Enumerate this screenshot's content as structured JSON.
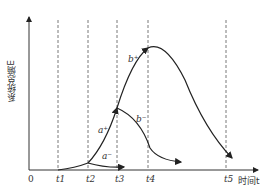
{
  "diagram": {
    "y_axis_label": "系统总熵E",
    "x_axis_label": "时间t",
    "origin": "0",
    "ticks": [
      "t1",
      "t2",
      "t3",
      "t4",
      "t5"
    ],
    "curve_labels": {
      "a_minus": "a⁻",
      "a_plus": "a⁺",
      "b_minus": "b⁻",
      "b_plus": "b⁺"
    },
    "line_color": "#333333"
  }
}
